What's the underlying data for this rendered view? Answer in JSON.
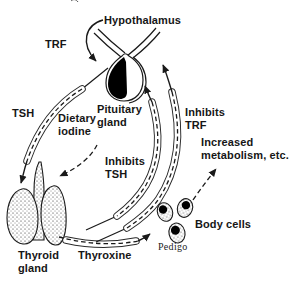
{
  "figure": {
    "colors": {
      "ink": "#1a1a1a",
      "background": "#ffffff",
      "pituitary_fill": "#000000"
    },
    "labels": {
      "hypothalamus": "Hypothalamus",
      "trf": "TRF",
      "tsh": "TSH",
      "pituitary_gland": [
        "Pituitary",
        "gland"
      ],
      "dietary_iodine": [
        "Dietary",
        "iodine"
      ],
      "inhibits_trf": [
        "Inhibits",
        "TRF"
      ],
      "inhibits_tsh": [
        "Inhibits",
        "TSH"
      ],
      "increased_metabolism": [
        "Increased",
        "metabolism, etc."
      ],
      "thyroid_gland": [
        "Thyroid",
        "gland"
      ],
      "thyroxine": "Thyroxine",
      "body_cells": "Body cells",
      "credit": "Pedigo"
    }
  }
}
